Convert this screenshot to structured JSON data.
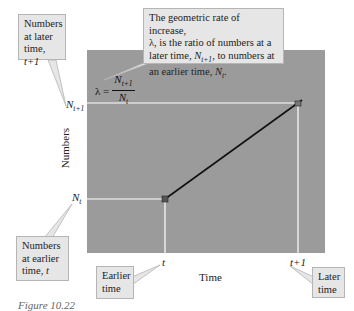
{
  "diagram": {
    "title": "Geometric rate of increase",
    "y_axis_label": "Numbers",
    "x_axis_label": "Time",
    "y_ticks": [
      {
        "base": "N",
        "sub": "t+1"
      },
      {
        "base": "N",
        "sub": "t"
      }
    ],
    "x_ticks": [
      {
        "label": "t"
      },
      {
        "label": "t+1"
      }
    ],
    "formula": {
      "lhs": "λ =",
      "numerator_base": "N",
      "numerator_sub": "t+1",
      "denominator_base": "N",
      "denominator_sub": "t"
    },
    "callouts": {
      "later_numbers": {
        "line1": "Numbers",
        "line2": "at later",
        "line3_prefix": "time, ",
        "line3_var": "t+1"
      },
      "rate_definition": {
        "line1": "The geometric rate of increase,",
        "line2": "λ, is the ratio of numbers at a",
        "line3_prefix": "later time, ",
        "line3_var": "N",
        "line3_sub": "t+1",
        "line3_suffix": ", to numbers at",
        "line4_prefix": "an earlier time, ",
        "line4_var": "N",
        "line4_sub": "t",
        "line4_suffix": "."
      },
      "earlier_numbers": {
        "line1": "Numbers",
        "line2": "at earlier",
        "line3_prefix": "time, ",
        "line3_var": "t"
      },
      "earlier_time": {
        "line1": "Earlier",
        "line2": "time"
      },
      "later_time": {
        "line1": "Later",
        "line2": "time"
      }
    },
    "caption": "Figure 10.22",
    "colors": {
      "plot_background": "#9b9b9b",
      "guide_lines": "#ffffff",
      "growth_line": "#111111",
      "callout_background": "#e6e6e6"
    }
  }
}
